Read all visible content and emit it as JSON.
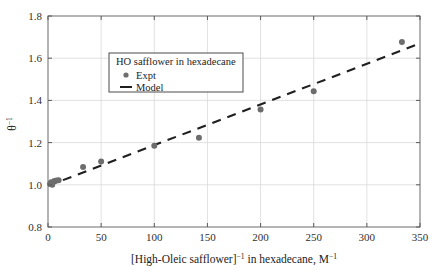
{
  "chart_data": {
    "type": "scatter",
    "title": "",
    "xlabel": "[High-Oleic safflower]⁻¹ in hexadecane, M⁻¹",
    "ylabel": "θ⁻¹",
    "xlim": [
      0,
      350
    ],
    "ylim": [
      0.8,
      1.8
    ],
    "xticks": [
      0,
      50,
      100,
      150,
      200,
      250,
      300,
      350
    ],
    "yticks": [
      0.8,
      1.0,
      1.2,
      1.4,
      1.6,
      1.8
    ],
    "xtick_labels": [
      "0",
      "50",
      "100",
      "150",
      "200",
      "250",
      "300",
      "350"
    ],
    "ytick_labels": [
      "0.8",
      "1.0",
      "1.2",
      "1.4",
      "1.6",
      "1.8"
    ],
    "grid": true,
    "grid_color": "#d9d9d9",
    "legend_position": "upper left",
    "legend_title": "HO safflower in hexadecane",
    "series": [
      {
        "name": "Expt",
        "type": "scatter",
        "marker": "circle",
        "color": "#6d6d6d",
        "points": [
          {
            "x": 2,
            "y": 1.005
          },
          {
            "x": 3,
            "y": 1.012
          },
          {
            "x": 4,
            "y": 1.0
          },
          {
            "x": 6,
            "y": 1.018
          },
          {
            "x": 8,
            "y": 1.02
          },
          {
            "x": 10,
            "y": 1.022
          },
          {
            "x": 33,
            "y": 1.084
          },
          {
            "x": 50,
            "y": 1.11
          },
          {
            "x": 100,
            "y": 1.185
          },
          {
            "x": 142,
            "y": 1.223
          },
          {
            "x": 200,
            "y": 1.357
          },
          {
            "x": 250,
            "y": 1.443
          },
          {
            "x": 333,
            "y": 1.677
          }
        ]
      },
      {
        "name": "Model",
        "type": "line",
        "style": "dashed",
        "color": "#1f1f1f",
        "slope": 0.00193,
        "intercept": 0.995,
        "points": [
          {
            "x": 0,
            "y": 0.995
          },
          {
            "x": 350,
            "y": 1.67
          }
        ]
      }
    ]
  },
  "legend": {
    "title": "HO safflower in hexadecane",
    "entries": [
      {
        "label": "Expt",
        "marker": "circle"
      },
      {
        "label": "Model",
        "marker": "dash"
      }
    ]
  },
  "axes": {
    "x_label_main": "[High-Oleic safflower]",
    "x_label_sup1": "−1",
    "x_label_mid": " in hexadecane, M",
    "x_label_sup2": "−1",
    "y_label_main": "θ",
    "y_label_sup": "−1"
  }
}
